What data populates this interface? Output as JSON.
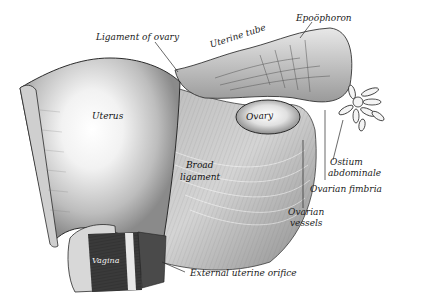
{
  "figure": {
    "style": "engraving",
    "colors": {
      "background": "#ffffff",
      "ink": "#2a2a2a",
      "tissue_light": "#e6e6e6",
      "tissue_mid": "#a9a9a9",
      "tissue_dark": "#4a4a4a"
    }
  },
  "labels": {
    "ligament_of_ovary": "Ligament of ovary",
    "uterine_tube": "Uterine tube",
    "epoophoron": "Epoöphoron",
    "uterus": "Uterus",
    "ovary": "Ovary",
    "broad_ligament_1": "Broad",
    "broad_ligament_2": "ligament",
    "ostium_abdominale_1": "Ostium",
    "ostium_abdominale_2": "abdominale",
    "ovarian_fimbria": "Ovarian fimbria",
    "ovarian_vessels_1": "Ovarian",
    "ovarian_vessels_2": "vessels",
    "vagina": "Vagina",
    "external_uterine_orifice": "External uterine orifice"
  }
}
